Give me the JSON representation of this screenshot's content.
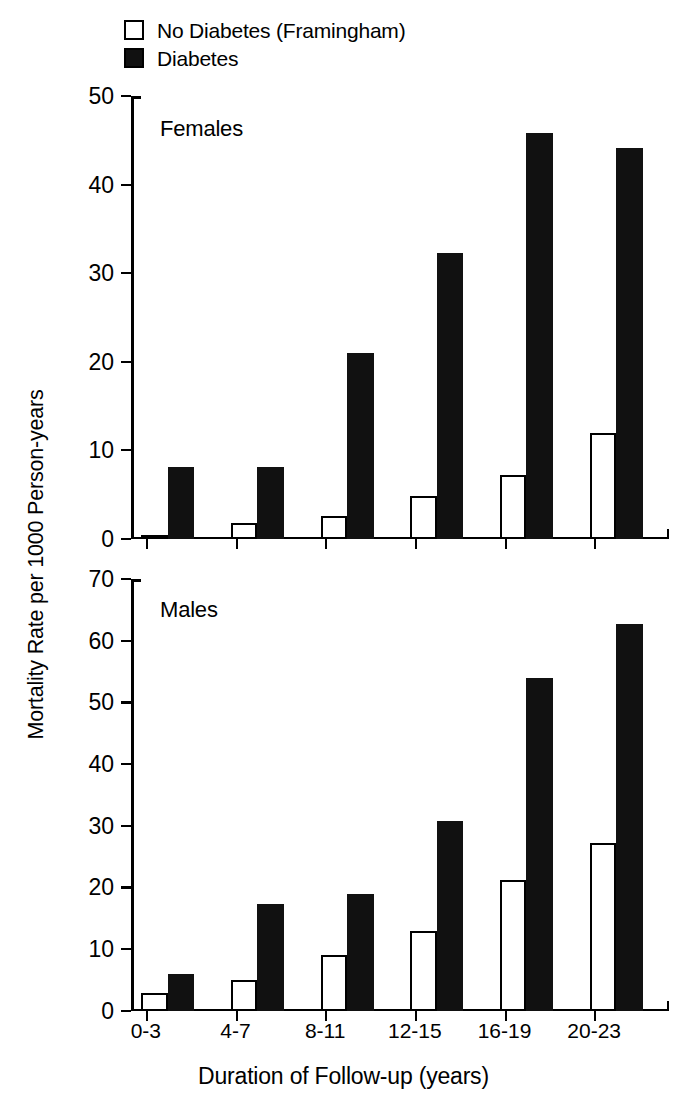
{
  "legend": {
    "items": [
      {
        "label": "No Diabetes (Framingham)",
        "style": "open"
      },
      {
        "label": "Diabetes",
        "style": "filled"
      }
    ]
  },
  "axis": {
    "y_title": "Mortality Rate per 1000 Person-years",
    "x_title": "Duration of Follow-up (years)"
  },
  "panels": {
    "females": {
      "title": "Females"
    },
    "males": {
      "title": "Males"
    }
  },
  "chart_data": [
    {
      "type": "bar",
      "title": "Females",
      "xlabel": "Duration of Follow-up (years)",
      "ylabel": "Mortality Rate per 1000 Person-years",
      "categories": [
        "0-3",
        "4-7",
        "8-11",
        "12-15",
        "16-19",
        "20-23"
      ],
      "ylim": [
        0,
        50
      ],
      "yticks": [
        0,
        10,
        20,
        30,
        40,
        50
      ],
      "grid": false,
      "legend_position": "top-left",
      "series": [
        {
          "name": "No Diabetes (Framingham)",
          "color": "#ffffff",
          "values": [
            0.4,
            1.8,
            2.6,
            4.8,
            7.2,
            12.0
          ]
        },
        {
          "name": "Diabetes",
          "color": "#111111",
          "values": [
            8.1,
            8.1,
            21.0,
            32.3,
            45.8,
            44.1
          ]
        }
      ]
    },
    {
      "type": "bar",
      "title": "Males",
      "xlabel": "Duration of Follow-up (years)",
      "ylabel": "Mortality Rate per 1000 Person-years",
      "categories": [
        "0-3",
        "4-7",
        "8-11",
        "12-15",
        "16-19",
        "20-23"
      ],
      "ylim": [
        0,
        70
      ],
      "yticks": [
        0,
        10,
        20,
        30,
        40,
        50,
        60,
        70
      ],
      "grid": false,
      "legend_position": "top-left",
      "series": [
        {
          "name": "No Diabetes (Framingham)",
          "color": "#ffffff",
          "values": [
            3.0,
            5.0,
            9.0,
            13.0,
            21.2,
            27.3
          ]
        },
        {
          "name": "Diabetes",
          "color": "#111111",
          "values": [
            6.0,
            17.4,
            19.0,
            30.8,
            53.9,
            62.7
          ]
        }
      ]
    }
  ]
}
